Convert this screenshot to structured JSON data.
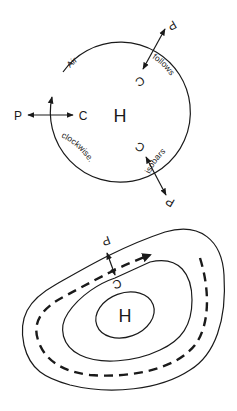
{
  "top_diagram": {
    "center_label": "H",
    "curved_text": [
      "Air",
      "follows",
      "isobars",
      "clockwise."
    ],
    "force_pairs": [
      {
        "position": "left",
        "pressure_label": "P",
        "coriolis_label": "C"
      },
      {
        "position": "top-right",
        "pressure_label": "P",
        "coriolis_label": "C"
      },
      {
        "position": "bottom-right",
        "pressure_label": "P",
        "coriolis_label": "C"
      }
    ]
  },
  "bottom_diagram": {
    "center_label": "H",
    "pressure_label": "P",
    "coriolis_label": "C"
  },
  "colors": {
    "ink": "#1a1a1a",
    "background": "#ffffff"
  }
}
